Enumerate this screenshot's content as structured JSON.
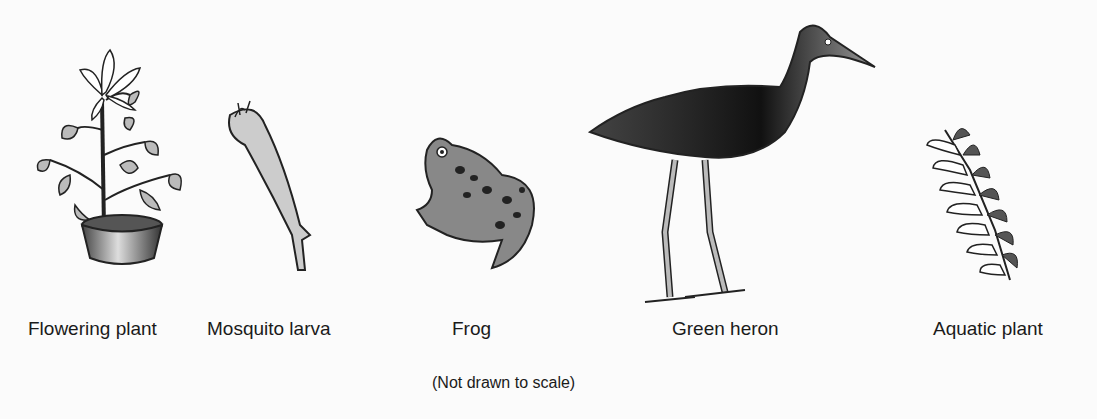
{
  "figure": {
    "organisms": [
      {
        "name": "Flowering plant",
        "icon": "flowering-plant-icon"
      },
      {
        "name": "Mosquito larva",
        "icon": "mosquito-larva-icon"
      },
      {
        "name": "Frog",
        "icon": "frog-icon"
      },
      {
        "name": "Green heron",
        "icon": "green-heron-icon"
      },
      {
        "name": "Aquatic plant",
        "icon": "aquatic-plant-icon"
      }
    ],
    "note": "(Not drawn to scale)"
  }
}
